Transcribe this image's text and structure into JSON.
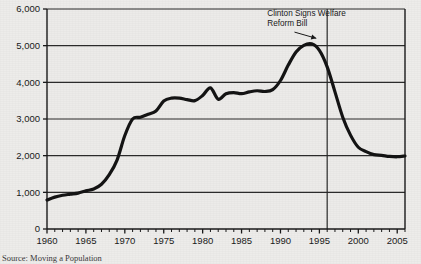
{
  "chart_data": {
    "type": "line",
    "title": "",
    "subtitle": "",
    "xlabel": "",
    "ylabel": "",
    "xlim": [
      1960,
      2006
    ],
    "ylim": [
      0,
      6000
    ],
    "grid": true,
    "legend_position": "none",
    "y_ticks": [
      0,
      1000,
      2000,
      3000,
      4000,
      5000,
      6000
    ],
    "y_tick_labels": [
      "0",
      "1,000",
      "2,000",
      "3,000",
      "4,000",
      "5,000",
      "6,000"
    ],
    "x_ticks": [
      1960,
      1965,
      1970,
      1975,
      1980,
      1985,
      1990,
      1995,
      2000,
      2005
    ],
    "x_tick_labels": [
      "1960",
      "1965",
      "1970",
      "1975",
      "1980",
      "1985",
      "1990",
      "1995",
      "2000",
      "2005"
    ],
    "x_minor_tick_step": 1,
    "series": [
      {
        "name": "Welfare caseload (thousands of families)",
        "color": "#141414",
        "line_width": 3.2,
        "x": [
          1960,
          1961,
          1962,
          1963,
          1964,
          1965,
          1966,
          1967,
          1968,
          1969,
          1970,
          1971,
          1972,
          1973,
          1974,
          1975,
          1976,
          1977,
          1978,
          1979,
          1980,
          1981,
          1982,
          1983,
          1984,
          1985,
          1986,
          1987,
          1988,
          1989,
          1990,
          1991,
          1992,
          1993,
          1994,
          1995,
          1996,
          1997,
          1998,
          1999,
          2000,
          2001,
          2002,
          2003,
          2004,
          2005,
          2006
        ],
        "values": [
          790,
          870,
          920,
          950,
          980,
          1040,
          1090,
          1220,
          1480,
          1880,
          2550,
          3000,
          3050,
          3130,
          3220,
          3490,
          3570,
          3570,
          3530,
          3500,
          3640,
          3850,
          3540,
          3690,
          3720,
          3690,
          3740,
          3770,
          3750,
          3800,
          4050,
          4470,
          4830,
          5010,
          5050,
          4870,
          4420,
          3740,
          3050,
          2560,
          2230,
          2110,
          2030,
          2010,
          1980,
          1970,
          1990
        ],
        "units": "thousands of families"
      }
    ],
    "annotations": [
      {
        "name": "clinton-welfare-reform-annotation",
        "text_lines": [
          "Clinton Signs Welfare",
          "Reform Bill"
        ],
        "text_x": 1988.3,
        "text_y": 5820,
        "arrow_from_x": 1991.8,
        "arrow_from_y": 5370,
        "arrow_to_x": 1994.6,
        "arrow_to_y": 5200
      }
    ],
    "vertical_lines": [
      {
        "name": "welfare-reform-year-line",
        "x": 1996,
        "color": "#2a2a2a"
      }
    ]
  },
  "source": {
    "label": "Source: Moving a Population"
  }
}
